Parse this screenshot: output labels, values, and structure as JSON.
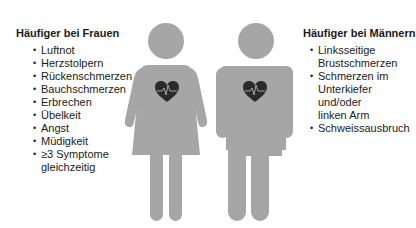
{
  "women": {
    "title": "Häufiger bei Frauen",
    "items": [
      {
        "text": "Luftnot"
      },
      {
        "text": "Herzstolpern"
      },
      {
        "text": "Rückenschmerzen"
      },
      {
        "text": "Bauchschmerzen"
      },
      {
        "text": "Erbrechen"
      },
      {
        "text": "Übelkeit"
      },
      {
        "text": "Angst"
      },
      {
        "text": "Müdigkeit"
      },
      {
        "text": "≥3 Symptome\ngleichzeitig"
      }
    ]
  },
  "men": {
    "title": "Häufiger bei Männern",
    "items": [
      {
        "text": "Linksseitige\nBrustschmerzen"
      },
      {
        "text": "Schmerzen im\nUnterkiefer\nund/oder\nlinken Arm"
      },
      {
        "text": "Schweissausbruch"
      }
    ]
  },
  "bullet_char": "•",
  "colors": {
    "figure": "#a6a6a6",
    "heart": "#2b2b2b",
    "ecg_line": "#a6a6a6",
    "text": "#1a1a1a"
  },
  "icons": {
    "woman": "woman-figure-icon",
    "man": "man-figure-icon",
    "heart": "heart-ecg-icon"
  }
}
